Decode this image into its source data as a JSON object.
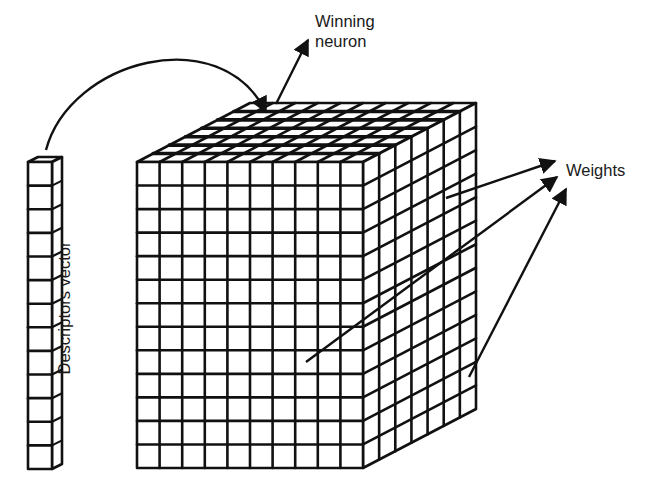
{
  "diagram": {
    "labels": {
      "winning_neuron_line1": "Winning",
      "winning_neuron_line2": "neuron",
      "weights": "Weights",
      "descriptors_vector": "Descriptors vector"
    },
    "descriptors_vector": {
      "cells": 13
    },
    "cube": {
      "columns": 10,
      "rows": 13,
      "depth": 7
    },
    "colors": {
      "stroke": "#111111",
      "background": "#ffffff",
      "text": "#1a1a1a"
    }
  }
}
